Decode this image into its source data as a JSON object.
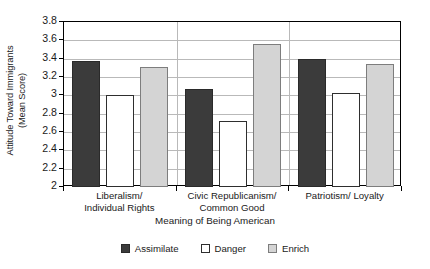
{
  "chart_data": {
    "type": "bar",
    "title": "",
    "xlabel": "Meaning of Being American",
    "ylabel": "Attitude Toward Immigrants (Mean Score)",
    "ylabel_line1": "Attitude Toward Immigrants",
    "ylabel_line2": "(Mean Score)",
    "categories": [
      "Liberalism/ Individual Rights",
      "Civic Republicanism/ Common Good",
      "Patriotism/ Loyalty"
    ],
    "category_lines": [
      [
        "Liberalism/",
        "Individual Rights"
      ],
      [
        "Civic Republicanism/",
        "Common Good"
      ],
      [
        "Patriotism/ Loyalty",
        ""
      ]
    ],
    "series": [
      {
        "name": "Assimilate",
        "color": "#3b3b3b",
        "values": [
          3.37,
          3.07,
          3.4
        ]
      },
      {
        "name": "Danger",
        "color": "#ffffff",
        "values": [
          3.0,
          2.72,
          3.03
        ]
      },
      {
        "name": "Enrich",
        "color": "#d4d4d4",
        "values": [
          3.31,
          3.56,
          3.34
        ]
      }
    ],
    "ylim": [
      2,
      3.8
    ],
    "ytick_values": [
      2,
      2.2,
      2.4,
      2.6,
      2.8,
      3,
      3.2,
      3.4,
      3.6,
      3.8
    ],
    "ytick_labels": [
      "2",
      "2.2",
      "2.4",
      "2.6",
      "2.8",
      "3",
      "3.2",
      "3.4",
      "3.6",
      "3.8"
    ],
    "grid": true,
    "legend_position": "bottom"
  },
  "legend": {
    "items": [
      {
        "label": "Assimilate",
        "swatch": "assimilate"
      },
      {
        "label": "Danger",
        "swatch": "danger"
      },
      {
        "label": "Enrich",
        "swatch": "enrich"
      }
    ]
  }
}
